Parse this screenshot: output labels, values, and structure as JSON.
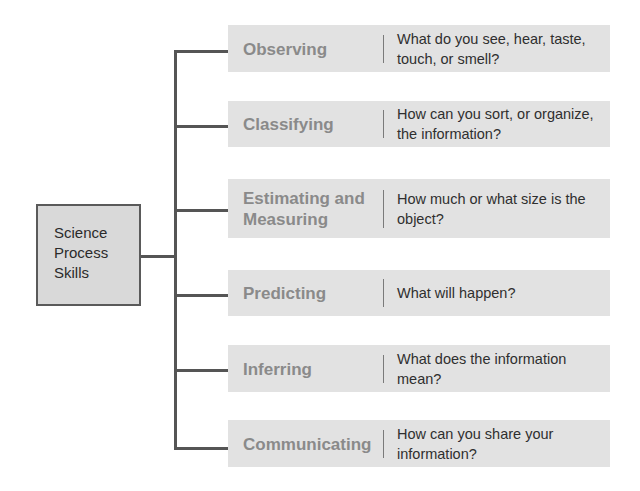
{
  "diagram": {
    "root": {
      "lines": [
        "Science",
        "Process",
        "Skills"
      ]
    },
    "skills": [
      {
        "name": "Observing",
        "question": "What do you see, hear, taste, touch, or smell?"
      },
      {
        "name": "Classifying",
        "question": "How can you sort, or organize, the information?"
      },
      {
        "name": "Estimating and Measuring",
        "question": "How much or what size is the object?"
      },
      {
        "name": "Predicting",
        "question": "What will happen?"
      },
      {
        "name": "Inferring",
        "question": "What does the information mean?"
      },
      {
        "name": "Communicating",
        "question": "How can you share your information?"
      }
    ]
  },
  "colors": {
    "row_background": "#e2e2e2",
    "root_background": "#d9d9d9",
    "connector": "#555555",
    "skill_text": "#8a8a8a",
    "question_text": "#2f2f2f"
  }
}
